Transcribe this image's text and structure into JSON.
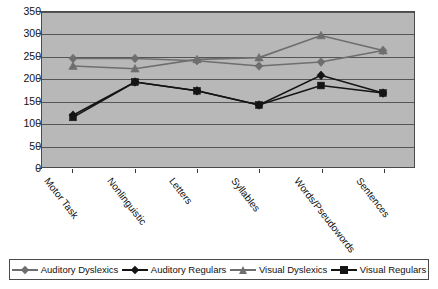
{
  "chart_data": {
    "type": "line",
    "title": "",
    "subtitle": "",
    "xlabel": "",
    "ylabel": "",
    "categories": [
      "Motor Task",
      "Nonlinguistic",
      "Letters",
      "Syllables",
      "Words/Pseudowords",
      "Sentences"
    ],
    "ylim": [
      0,
      350
    ],
    "yticks": [
      0,
      50,
      100,
      150,
      200,
      250,
      300,
      350
    ],
    "ytick_labels": [
      "0",
      "50",
      "100",
      "150",
      "200",
      "250",
      "300",
      "350"
    ],
    "grid": true,
    "legend_position": "bottom",
    "plot_background": "#b8b8b8",
    "series": [
      {
        "name": "Auditory Dyslexics",
        "values": [
          245,
          245,
          240,
          228,
          237,
          263
        ],
        "color": "#6e6e6e",
        "marker": "diamond"
      },
      {
        "name": "Auditory Regulars",
        "values": [
          117,
          192,
          172,
          140,
          207,
          167
        ],
        "color": "#141414",
        "marker": "diamond"
      },
      {
        "name": "Visual Dyslexics",
        "values": [
          228,
          222,
          243,
          247,
          297,
          263
        ],
        "color": "#6e6e6e",
        "marker": "triangle"
      },
      {
        "name": "Visual Regulars",
        "values": [
          112,
          192,
          172,
          140,
          184,
          167
        ],
        "color": "#141414",
        "marker": "square"
      }
    ]
  },
  "legend": {
    "items": [
      {
        "label": "Auditory Dyslexics"
      },
      {
        "label": "Auditory Regulars"
      },
      {
        "label": "Visual Dyslexics"
      },
      {
        "label": "Visual Regulars"
      }
    ]
  }
}
